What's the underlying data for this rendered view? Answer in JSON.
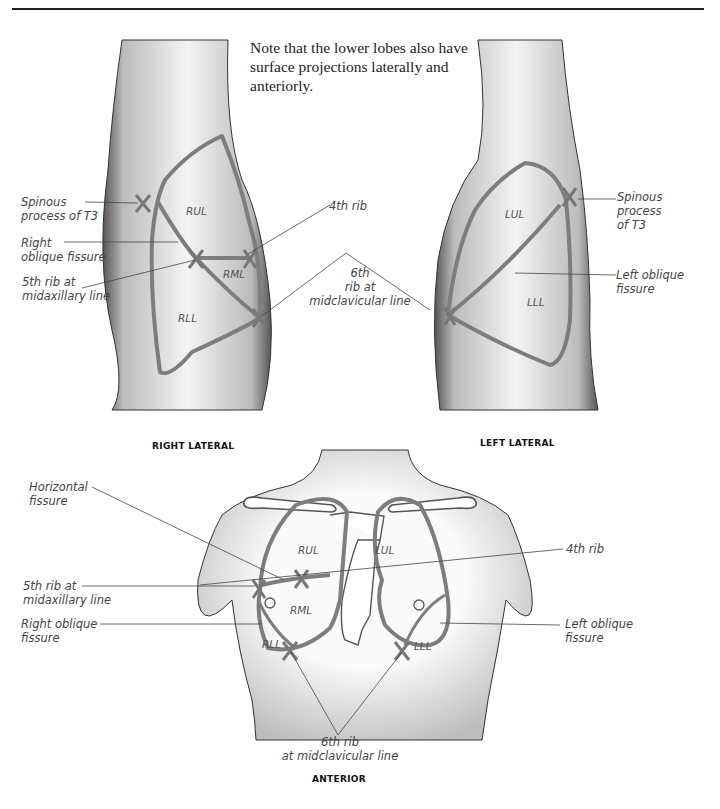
{
  "page": {
    "note": "Note that the lower lobes also have surface projections laterally and anteriorly."
  },
  "colors": {
    "lung_outline": "#7d7d7d",
    "skin_shading": "#9a9a9a",
    "leader_line": "#444444",
    "text": "#444444"
  },
  "right_lateral": {
    "caption": "RIGHT LATERAL",
    "lobes": {
      "upper": "RUL",
      "middle": "RML",
      "lower": "RLL"
    },
    "labels": {
      "spinous": "Spinous\nprocess of T3",
      "oblique": "Right\noblique fissure",
      "fifth_rib": "5th rib at\nmidaxillary line",
      "fourth_rib": "4th rib"
    }
  },
  "shared": {
    "sixth_rib": "6th\nrib at\nmidclavicular line"
  },
  "left_lateral": {
    "caption": "LEFT LATERAL",
    "lobes": {
      "upper": "LUL",
      "lower": "LLL"
    },
    "labels": {
      "spinous": "Spinous\nprocess\nof T3",
      "oblique": "Left oblique\nfissure"
    }
  },
  "anterior": {
    "caption": "ANTERIOR",
    "lobes": {
      "rul": "RUL",
      "rml": "RML",
      "rll": "RLL",
      "lul": "LUL",
      "lll": "LLL"
    },
    "labels": {
      "horizontal": "Horizontal\nfissure",
      "fifth_rib": "5th rib at\nmidaxillary line",
      "right_oblique": "Right oblique\nfissure",
      "fourth_rib": "4th rib",
      "left_oblique": "Left oblique\nfissure",
      "sixth_rib": "6th rib\nat midclavicular line"
    }
  }
}
